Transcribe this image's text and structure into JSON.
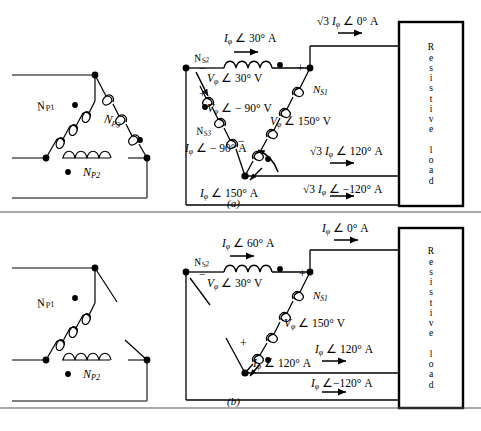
{
  "figure": {
    "title_a": "(a)",
    "title_b": "(b)"
  },
  "panel_a": {
    "primary": {
      "name": "closed-delta-primary",
      "windings": [
        {
          "label_main": "N",
          "label_sub": "P1",
          "text": "N_P1"
        },
        {
          "label_main": "N",
          "label_sub": "P2",
          "text": "N_P2"
        },
        {
          "label_main": "N",
          "label_sub": "P3",
          "text": "N_P3"
        }
      ]
    },
    "secondary": {
      "name": "closed-delta-secondary",
      "windings": [
        {
          "label_main": "N",
          "label_sub": "S1",
          "text": "N_S1"
        },
        {
          "label_main": "N",
          "label_sub": "S2",
          "text": "N_S2"
        },
        {
          "label_main": "N",
          "label_sub": "S3",
          "text": "N_S3"
        }
      ],
      "voltages": [
        {
          "mag": "V",
          "phi": "φ",
          "angle": "∠ 30°",
          "unit": "V"
        },
        {
          "mag": "V",
          "phi": "φ",
          "angle": "∠ − 90°",
          "unit": "V"
        },
        {
          "mag": "V",
          "phi": "φ",
          "angle": "∠ 150°",
          "unit": "V"
        }
      ],
      "phase_currents": [
        {
          "mag": "I",
          "phi": "φ",
          "angle": "∠ 30°",
          "unit": "A"
        },
        {
          "mag": "I",
          "phi": "φ",
          "angle": "∠ − 90°",
          "unit": "A"
        },
        {
          "mag": "I",
          "phi": "φ",
          "angle": "∠ 150°",
          "unit": "A"
        }
      ],
      "line_currents": [
        {
          "prefix": "√3",
          "mag": "I",
          "phi": "φ",
          "angle": "∠ 0°",
          "unit": "A"
        },
        {
          "prefix": "√3",
          "mag": "I",
          "phi": "φ",
          "angle": "∠ 120°",
          "unit": "A"
        },
        {
          "prefix": "√3",
          "mag": "I",
          "phi": "φ",
          "angle": "∠ −120°",
          "unit": "A"
        }
      ],
      "polarity_marks": [
        "−",
        "+",
        "−",
        "+"
      ]
    },
    "load": {
      "name": "resistive-load-a",
      "text": "Resistive load"
    }
  },
  "panel_b": {
    "primary": {
      "name": "open-delta-primary",
      "windings": [
        {
          "label_main": "N",
          "label_sub": "P1",
          "text": "N_P1"
        },
        {
          "label_main": "N",
          "label_sub": "P2",
          "text": "N_P2"
        }
      ]
    },
    "secondary": {
      "name": "open-delta-secondary",
      "windings": [
        {
          "label_main": "N",
          "label_sub": "S1",
          "text": "N_S1"
        },
        {
          "label_main": "N",
          "label_sub": "S2",
          "text": "N_S2"
        }
      ],
      "voltages": [
        {
          "mag": "V",
          "phi": "φ",
          "angle": "∠ 30°",
          "unit": "V"
        },
        {
          "mag": "V",
          "phi": "φ",
          "angle": "∠ 150°",
          "unit": "V"
        }
      ],
      "phase_currents": [
        {
          "mag": "I",
          "phi": "φ",
          "angle": "∠ 60°",
          "unit": "A"
        },
        {
          "mag": "I",
          "phi": "φ",
          "angle": "∠ 120°",
          "unit": "A"
        }
      ],
      "line_currents": [
        {
          "mag": "I",
          "phi": "φ",
          "angle": "∠ 0°",
          "unit": "A"
        },
        {
          "mag": "I",
          "phi": "φ",
          "angle": "∠ 120°",
          "unit": "A"
        },
        {
          "mag": "I",
          "phi": "φ",
          "angle": "∠−120°",
          "unit": "A"
        }
      ],
      "polarity_marks": [
        "−",
        "+",
        "+"
      ]
    },
    "load": {
      "name": "resistive-load-b",
      "text": "Resistive load"
    }
  },
  "labels": {
    "a_NP1": "N",
    "a_NP1s": "P1",
    "a_NP2": "N",
    "a_NP2s": "P2",
    "a_NP3": "N",
    "a_NP3s": "P3",
    "a_NS1": "N",
    "a_NS1s": "S1",
    "a_NS2": "N",
    "a_NS2s": "S2",
    "a_NS3": "N",
    "a_NS3s": "S3",
    "b_NP1": "N",
    "b_NP1s": "P1",
    "b_NP2": "N",
    "b_NP2s": "P2",
    "b_NS1": "N",
    "b_NS1s": "S1",
    "b_NS2": "N",
    "b_NS2s": "S2",
    "a_i30": "I",
    "a_i30_a": "∠ 30° A",
    "a_im90": "I",
    "a_im90_a": "∠ − 90° A",
    "a_i150": "I",
    "a_i150_a": "∠ 150° A",
    "a_v30": "V",
    "a_v30_a": "∠ 30° V",
    "a_vm90": "V",
    "a_vm90_a": "∠ − 90° V",
    "a_v150": "V",
    "a_v150_a": "∠ 150° V",
    "a_l0": "√3",
    "a_l0_i": "I",
    "a_l0_a": "∠ 0° A",
    "a_l120": "√3",
    "a_l120_i": "I",
    "a_l120_a": "∠ 120° A",
    "a_lm120": "√3",
    "a_lm120_i": "I",
    "a_lm120_a": "∠ −120° A",
    "b_i60": "I",
    "b_i60_a": "∠ 60° A",
    "b_i120": "I",
    "b_i120_a": "∠ 120° A",
    "b_v30": "V",
    "b_v30_a": "∠ 30° V",
    "b_v150": "V",
    "b_v150_a": "∠ 150° V",
    "b_l0": "I",
    "b_l0_a": "∠ 0° A",
    "b_l120": "I",
    "b_l120_a": "∠ 120° A",
    "b_lm120": "I",
    "b_lm120_a": "∠−120° A",
    "phi": "φ",
    "plus": "+",
    "minus": "−",
    "cap_a": "(a)",
    "cap_b": "(b)",
    "load_letters": [
      "R",
      "e",
      "s",
      "i",
      "s",
      "t",
      "i",
      "v",
      "e",
      " ",
      "l",
      "o",
      "a",
      "d"
    ]
  },
  "colors": {
    "line": "#000000",
    "wire": "#555555",
    "box": "#000000"
  }
}
